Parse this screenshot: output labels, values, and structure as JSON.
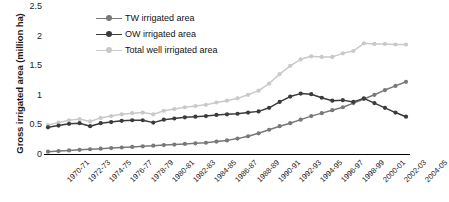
{
  "chart_data": {
    "type": "line",
    "title": "",
    "xlabel": "",
    "ylabel": "Gross irrigated area (million ha)",
    "ylim": [
      0,
      2.5
    ],
    "yticks": [
      "0",
      "0.5",
      "1",
      "1.5",
      "2",
      "2.5"
    ],
    "ytick_values": [
      0,
      0.5,
      1,
      1.5,
      2,
      2.5
    ],
    "grid": false,
    "legend_position": "top-center-left inside plot",
    "x": [
      "1970-71",
      "1971-72",
      "1972-73",
      "1973-74",
      "1974-75",
      "1975-76",
      "1976-77",
      "1977-78",
      "1978-79",
      "1979-80",
      "1980-81",
      "1981-82",
      "1982-83",
      "1983-84",
      "1984-85",
      "1985-86",
      "1986-87",
      "1987-88",
      "1988-89",
      "1989-90",
      "1990-91",
      "1991-92",
      "1992-93",
      "1993-94",
      "1994-95",
      "1995-96",
      "1996-97",
      "1997-98",
      "1998-99",
      "1999-2000",
      "2000-01",
      "2001-02",
      "2002-03",
      "2003-04",
      "2004-05"
    ],
    "xtick_labels": [
      "1970-71",
      "1972-73",
      "1974-75",
      "1976-77",
      "1978-79",
      "1980-81",
      "1982-83",
      "1984-85",
      "1986-87",
      "1988-89",
      "1990-91",
      "1992-93",
      "1994-95",
      "1996-97",
      "1998-99",
      "2000-01",
      "2002-03",
      "2004-05"
    ],
    "xtick_indices": [
      0,
      2,
      4,
      6,
      8,
      10,
      12,
      14,
      16,
      18,
      20,
      22,
      24,
      26,
      28,
      30,
      32,
      34
    ],
    "series": [
      {
        "name": "TW irrigated area",
        "color": "#787878",
        "values": [
          0.04,
          0.05,
          0.06,
          0.07,
          0.08,
          0.09,
          0.1,
          0.11,
          0.12,
          0.13,
          0.14,
          0.15,
          0.16,
          0.17,
          0.18,
          0.19,
          0.21,
          0.23,
          0.26,
          0.3,
          0.35,
          0.41,
          0.47,
          0.52,
          0.58,
          0.64,
          0.69,
          0.74,
          0.79,
          0.86,
          0.93,
          1.0,
          1.08,
          1.15,
          1.22
        ]
      },
      {
        "name": "OW irrigated area",
        "color": "#3b3b3b",
        "values": [
          0.45,
          0.48,
          0.51,
          0.52,
          0.47,
          0.52,
          0.54,
          0.56,
          0.57,
          0.57,
          0.53,
          0.58,
          0.6,
          0.62,
          0.63,
          0.64,
          0.66,
          0.67,
          0.68,
          0.7,
          0.72,
          0.78,
          0.88,
          0.97,
          1.02,
          1.01,
          0.95,
          0.9,
          0.91,
          0.88,
          0.94,
          0.86,
          0.78,
          0.7,
          0.63
        ]
      },
      {
        "name": "Total well irrigated area",
        "color": "#c9c9c9",
        "values": [
          0.49,
          0.53,
          0.57,
          0.59,
          0.55,
          0.61,
          0.64,
          0.67,
          0.69,
          0.7,
          0.67,
          0.73,
          0.76,
          0.79,
          0.81,
          0.83,
          0.87,
          0.9,
          0.94,
          1.0,
          1.07,
          1.19,
          1.35,
          1.49,
          1.6,
          1.65,
          1.64,
          1.64,
          1.7,
          1.74,
          1.87,
          1.86,
          1.86,
          1.85,
          1.85
        ]
      }
    ]
  },
  "legend": {
    "items": [
      {
        "label": "TW irrigated area",
        "color": "#787878"
      },
      {
        "label": "OW irrigated area",
        "color": "#3b3b3b"
      },
      {
        "label": "Total well irrigated area",
        "color": "#c9c9c9"
      }
    ]
  },
  "axes": {
    "y_title": "Gross irrigated area (million ha)"
  }
}
